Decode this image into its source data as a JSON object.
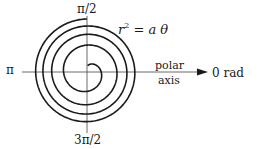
{
  "figure": {
    "equation": {
      "lhs_var": "r",
      "lhs_exp": "2",
      "rhs": "= a θ"
    },
    "angle_labels": {
      "top": "π/2",
      "left": "π",
      "bottom": "3π/2",
      "right": "0 rad"
    },
    "axis_label": {
      "line1": "polar",
      "line2": "axis"
    },
    "colors": {
      "ink": "#1a1a1a",
      "background": "#ffffff"
    }
  }
}
